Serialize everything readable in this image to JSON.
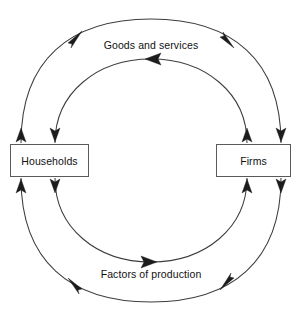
{
  "diagram": {
    "background_color": "#ffffff",
    "line_color": "#3d3d3d",
    "arrow_color": "#1c1c1c",
    "box_border_color": "#5a5a5a",
    "text_color": "#111111",
    "entities": [
      {
        "id": "households",
        "label": "Households"
      },
      {
        "id": "firms",
        "label": "Firms"
      }
    ],
    "flows": [
      {
        "id": "goods-and-services",
        "label": "Goods and services",
        "position": "inner-top",
        "direction": "firms-to-households",
        "arrow_direction": "left"
      },
      {
        "id": "factors-of-production",
        "label": "Factors of production",
        "position": "inner-bottom",
        "direction": "households-to-firms",
        "arrow_direction": "right"
      },
      {
        "id": "outer-top-flow",
        "label": "",
        "position": "outer-top",
        "direction": "households-to-firms",
        "arrow_direction": "clockwise"
      },
      {
        "id": "outer-bottom-flow",
        "label": "",
        "position": "outer-bottom",
        "direction": "firms-to-households",
        "arrow_direction": "counterclockwise"
      }
    ]
  }
}
